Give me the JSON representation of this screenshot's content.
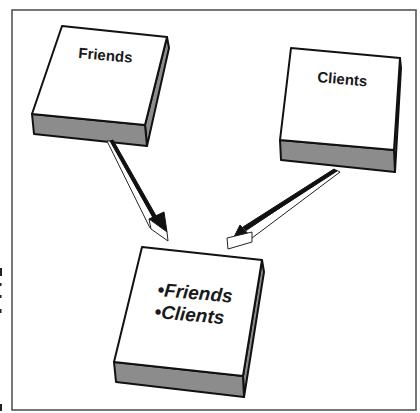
{
  "diagram": {
    "type": "merge-lists",
    "colors": {
      "face": "#ffffff",
      "side": "#8c8c8c",
      "outline": "#111111",
      "frame": "#555555"
    },
    "sources": [
      {
        "id": "friends",
        "label": "Friends"
      },
      {
        "id": "clients",
        "label": "Clients"
      }
    ],
    "target": {
      "id": "merged",
      "items": [
        "•Friends",
        "•Clients"
      ]
    },
    "edges": [
      {
        "from": "friends",
        "to": "merged"
      },
      {
        "from": "clients",
        "to": "merged"
      }
    ]
  }
}
